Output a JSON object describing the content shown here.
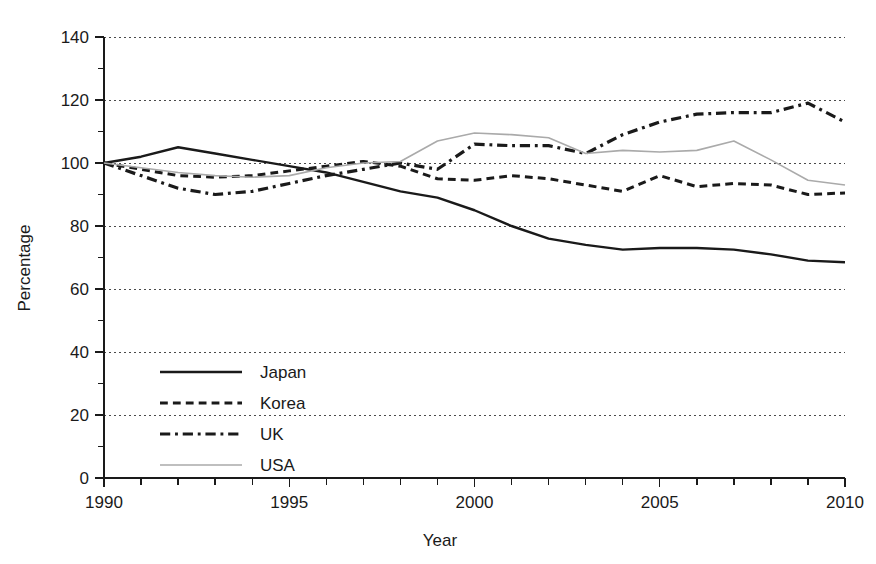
{
  "chart_data": {
    "type": "line",
    "title": "",
    "xlabel": "Year",
    "ylabel": "Percentage",
    "xlim": [
      1990,
      2010
    ],
    "ylim": [
      0,
      140
    ],
    "grid": true,
    "legend_position": "lower-left-inside",
    "x": [
      1990,
      1991,
      1992,
      1993,
      1994,
      1995,
      1996,
      1997,
      1998,
      1999,
      2000,
      2001,
      2002,
      2003,
      2004,
      2005,
      2006,
      2007,
      2008,
      2009,
      2010
    ],
    "xticks": [
      1990,
      1995,
      2000,
      2005,
      2010
    ],
    "xtick_labels": [
      "1990",
      "1995",
      "2000",
      "2005",
      "2010"
    ],
    "yticks": [
      0,
      20,
      40,
      60,
      80,
      100,
      120,
      140
    ],
    "ytick_labels": [
      "0",
      "20",
      "40",
      "60",
      "80",
      "100",
      "120",
      "140"
    ],
    "yminor_ticks": [
      10,
      30,
      50,
      70,
      90,
      110,
      130
    ],
    "series": [
      {
        "name": "Japan",
        "style": "solid",
        "color": "#1a1a1a",
        "width": 2.4,
        "values": [
          100,
          102,
          105,
          103,
          101,
          99,
          97,
          94,
          91,
          89,
          85,
          80,
          76,
          74,
          72.5,
          73,
          73,
          72.5,
          71,
          69,
          68.5
        ]
      },
      {
        "name": "Korea",
        "style": "dashed",
        "color": "#1a1a1a",
        "width": 3.0,
        "values": [
          100,
          98,
          96,
          95.5,
          96,
          97.5,
          99,
          100.5,
          99,
          95,
          94.5,
          96,
          95,
          93,
          91,
          96,
          92.5,
          93.5,
          93,
          90,
          90.5
        ]
      },
      {
        "name": "UK",
        "style": "dashdot",
        "color": "#1a1a1a",
        "width": 3.2,
        "values": [
          100,
          96,
          92,
          90,
          91,
          93.5,
          96,
          98,
          100,
          98,
          106,
          105.5,
          105.5,
          103,
          109,
          113,
          115.5,
          116,
          116,
          119,
          113
        ]
      },
      {
        "name": "USA",
        "style": "thin-solid",
        "color": "#aaaaaa",
        "width": 1.6,
        "values": [
          100,
          98.5,
          97,
          96,
          95.5,
          96,
          98.5,
          100,
          100.5,
          107,
          109.5,
          109,
          108,
          103,
          104,
          103.5,
          104,
          107,
          101,
          94.5,
          93
        ]
      }
    ]
  },
  "legend": {
    "entries": [
      {
        "label": "Japan"
      },
      {
        "label": "Korea"
      },
      {
        "label": "UK"
      },
      {
        "label": "USA"
      }
    ]
  },
  "axes": {
    "y_title": "Percentage",
    "x_title": "Year"
  }
}
